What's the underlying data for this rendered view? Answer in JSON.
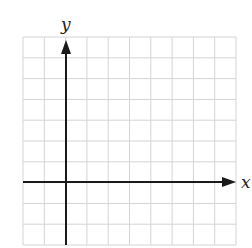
{
  "diagram": {
    "type": "coordinate_grid",
    "x_axis_label": "x",
    "y_axis_label": "y",
    "grid": {
      "columns": 10,
      "rows": 10,
      "origin_col": 2,
      "origin_row_from_top": 7
    },
    "colors": {
      "grid": "#d4d4d4",
      "axis": "#1a1a1a",
      "background": "#ffffff"
    }
  }
}
